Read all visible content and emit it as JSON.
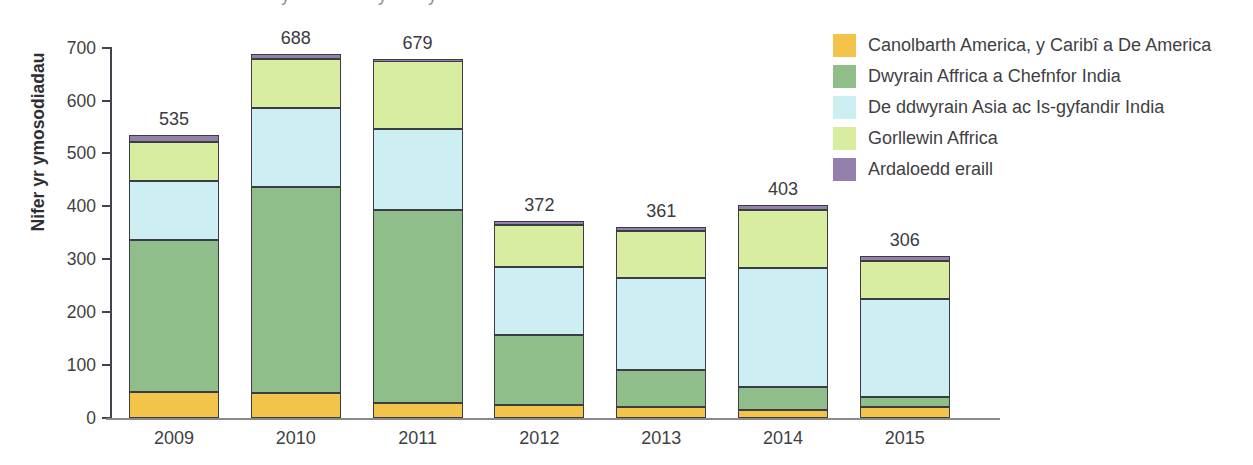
{
  "artifacts": {
    "cropped_title_descenders": [
      "y",
      "y",
      "y"
    ]
  },
  "chart_data": {
    "type": "bar",
    "stacked": true,
    "title": "",
    "xlabel": "",
    "ylabel": "Nifer yr ymosodiadau",
    "ylim": [
      0,
      700
    ],
    "yticks": [
      0,
      100,
      200,
      300,
      400,
      500,
      600,
      700
    ],
    "grid": false,
    "legend_position": "top-right",
    "categories": [
      "2009",
      "2010",
      "2011",
      "2012",
      "2013",
      "2014",
      "2015"
    ],
    "totals": [
      535,
      688,
      679,
      372,
      361,
      403,
      306
    ],
    "series": [
      {
        "name": "Canolbarth America, y Caribî a De America",
        "color": "#f2c54a",
        "values": [
          50,
          48,
          28,
          24,
          21,
          16,
          20
        ]
      },
      {
        "name": "Dwyrain Affrica a Chefnfor India",
        "color": "#8fbe8b",
        "values": [
          286,
          388,
          366,
          133,
          70,
          43,
          20
        ]
      },
      {
        "name": "De ddwyrain Asia ac Is-gyfandir India",
        "color": "#cdeff3",
        "values": [
          111,
          149,
          152,
          128,
          173,
          225,
          184
        ]
      },
      {
        "name": "Gorllewin Affrica",
        "color": "#d8eda0",
        "values": [
          75,
          94,
          128,
          80,
          89,
          110,
          72
        ]
      },
      {
        "name": "Ardaloedd eraill",
        "color": "#9380ac",
        "values": [
          13,
          9,
          5,
          7,
          8,
          9,
          10
        ]
      }
    ],
    "colors": {
      "bar_border": "#3c3c44",
      "axis_y": "#43434b",
      "axis_x": "#8a8a8e",
      "text": "#3f3f44"
    }
  }
}
